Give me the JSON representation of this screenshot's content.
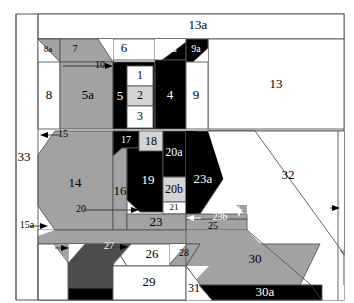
{
  "figure": {
    "type": "technical-region-diagram",
    "title": "",
    "palette": {
      "white": "#ffffff",
      "light_gray": "#d4d4d4",
      "mid_gray": "#a2a2a2",
      "dark_gray": "#4c4c4c",
      "black": "#000000",
      "outline": "#555555",
      "label_dark": "#000000",
      "label_light": "#ffffff"
    },
    "regions": [
      {
        "id": "1",
        "label": "1",
        "fill": "white",
        "text": "dark"
      },
      {
        "id": "2",
        "label": "2",
        "fill": "light_gray",
        "text": "dark"
      },
      {
        "id": "3",
        "label": "3",
        "fill": "white",
        "text": "dark"
      },
      {
        "id": "4",
        "label": "4",
        "fill": "black",
        "text": "light"
      },
      {
        "id": "5",
        "label": "5",
        "fill": "black",
        "text": "light"
      },
      {
        "id": "5a",
        "label": "5a",
        "fill": "none",
        "text": "dark",
        "leader": "arrow-right"
      },
      {
        "id": "6",
        "label": "6",
        "fill": "mid_gray",
        "text": "dark"
      },
      {
        "id": "7",
        "label": "7",
        "fill": "white",
        "text": "dark"
      },
      {
        "id": "7a",
        "label": "7a",
        "fill": "mid_gray",
        "text": "dark"
      },
      {
        "id": "7b",
        "label": "7b",
        "fill": "black",
        "text": "light"
      },
      {
        "id": "8",
        "label": "8",
        "fill": "white",
        "text": "dark"
      },
      {
        "id": "8a",
        "label": "8a",
        "fill": "mid_gray",
        "text": "dark"
      },
      {
        "id": "9",
        "label": "9",
        "fill": "white",
        "text": "dark"
      },
      {
        "id": "9a",
        "label": "9a",
        "fill": "black",
        "text": "light"
      },
      {
        "id": "10",
        "label": "10",
        "fill": "white",
        "text": "dark"
      },
      {
        "id": "11",
        "label": "11",
        "fill": "white",
        "text": "dark"
      },
      {
        "id": "12",
        "label": "12",
        "fill": "mid_gray",
        "text": "dark"
      },
      {
        "id": "12a",
        "label": "12a",
        "fill": "none",
        "text": "dark",
        "leader": "arrow-left"
      },
      {
        "id": "12a2",
        "label": "12a",
        "fill": "none",
        "text": "dark",
        "leader": "arrow-right"
      },
      {
        "id": "13",
        "label": "13",
        "fill": "mid_gray",
        "text": "dark"
      },
      {
        "id": "13a",
        "label": "13a",
        "fill": "black",
        "text": "light"
      },
      {
        "id": "14",
        "label": "14",
        "fill": "light_gray",
        "text": "dark"
      },
      {
        "id": "15",
        "label": "15",
        "fill": "black",
        "text": "light"
      },
      {
        "id": "15a",
        "label": "15a",
        "fill": "none",
        "text": "dark",
        "leader": "arrow-right"
      },
      {
        "id": "16",
        "label": "16",
        "fill": "black",
        "text": "light"
      },
      {
        "id": "17",
        "label": "17",
        "fill": "light_gray",
        "text": "dark"
      },
      {
        "id": "18",
        "label": "18",
        "fill": "white",
        "text": "dark"
      },
      {
        "id": "19",
        "label": "19",
        "fill": "mid_gray",
        "text": "dark"
      },
      {
        "id": "20",
        "label": "20",
        "fill": "black",
        "text": "light"
      },
      {
        "id": "20a",
        "label": "20a",
        "fill": "none",
        "text": "light",
        "leader": "arrow-left"
      },
      {
        "id": "20b",
        "label": "20b",
        "fill": "none",
        "text": "light",
        "leader": "arrow-down"
      },
      {
        "id": "21",
        "label": "21",
        "fill": "mid_gray",
        "text": "dark"
      },
      {
        "id": "23",
        "label": "23",
        "fill": "white",
        "text": "dark"
      },
      {
        "id": "23a",
        "label": "23a",
        "fill": "none",
        "text": "light",
        "leader": "arrow-right"
      },
      {
        "id": "23b",
        "label": "23b",
        "fill": "mid_gray",
        "text": "dark"
      },
      {
        "id": "24",
        "label": "24",
        "fill": "white",
        "text": "dark"
      },
      {
        "id": "25",
        "label": "25",
        "fill": "mid_gray",
        "text": "dark"
      },
      {
        "id": "26",
        "label": "26",
        "fill": "black",
        "text": "light"
      },
      {
        "id": "27",
        "label": "27",
        "fill": "white",
        "text": "dark"
      },
      {
        "id": "28",
        "label": "28",
        "fill": "dark_gray",
        "text": "light"
      },
      {
        "id": "29",
        "label": "29",
        "fill": "black",
        "text": "light"
      },
      {
        "id": "30",
        "label": "30",
        "fill": "white",
        "text": "dark"
      },
      {
        "id": "30a",
        "label": "30a",
        "fill": "none",
        "text": "dark",
        "leader": "arrow-right"
      },
      {
        "id": "31",
        "label": "31",
        "fill": "white",
        "text": "dark"
      },
      {
        "id": "32",
        "label": "32",
        "fill": "none",
        "text": "dark",
        "leader": "arrow-right"
      },
      {
        "id": "33",
        "label": "33",
        "fill": "none",
        "text": "dark"
      }
    ]
  }
}
